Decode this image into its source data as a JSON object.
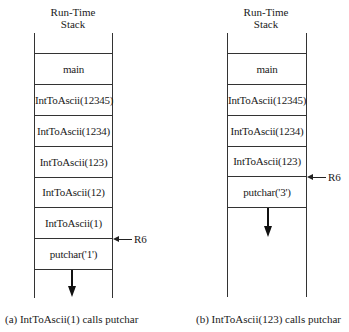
{
  "panels": [
    {
      "id": "a",
      "title": [
        "Run-Time",
        "Stack"
      ],
      "frames": [
        "main",
        "IntToAscii(12345)",
        "IntToAscii(1234)",
        "IntToAscii(123)",
        "IntToAscii(12)",
        "IntToAscii(1)",
        "putchar('1')"
      ],
      "pointer_label": "R6",
      "pointer_frame": "putchar('1')",
      "caption": "(a) IntToAscii(1) calls putchar"
    },
    {
      "id": "b",
      "title": [
        "Run-Time",
        "Stack"
      ],
      "frames": [
        "main",
        "IntToAscii(12345)",
        "IntToAscii(1234)",
        "IntToAscii(123)",
        "putchar('3')"
      ],
      "pointer_label": "R6",
      "pointer_frame": "putchar('3')",
      "caption": "(b) IntToAscii(123) calls putchar"
    }
  ]
}
